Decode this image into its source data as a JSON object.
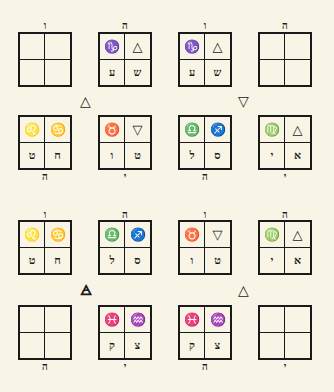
{
  "diagram": {
    "rows": [
      {
        "boxes": [
          {
            "top_label": "ו",
            "bottom_label": "",
            "cells": [
              "",
              "",
              "",
              ""
            ]
          },
          {
            "top_label": "ה",
            "bottom_label": "",
            "cells": [
              "♑",
              "△",
              "ע",
              "ש"
            ]
          },
          {
            "top_label": "ו",
            "bottom_label": "",
            "cells": [
              "♑",
              "△",
              "ע",
              "ש"
            ]
          },
          {
            "top_label": "ה",
            "bottom_label": "",
            "cells": [
              "",
              "",
              "",
              ""
            ]
          }
        ]
      },
      {
        "boxes": [
          {
            "top_label": "",
            "bottom_label": "ה",
            "cells": [
              "♌",
              "♋",
              "ט",
              "ח"
            ]
          },
          {
            "top_label": "",
            "bottom_label": "י",
            "cells": [
              "♉",
              "▽",
              "ו",
              "ט"
            ]
          },
          {
            "top_label": "",
            "bottom_label": "ה",
            "cells": [
              "♎",
              "♐",
              "ל",
              "ס"
            ]
          },
          {
            "top_label": "",
            "bottom_label": "י",
            "cells": [
              "♍",
              "△",
              "י",
              "א"
            ]
          }
        ]
      },
      {
        "boxes": [
          {
            "top_label": "ו",
            "bottom_label": "",
            "cells": [
              "♌",
              "♋",
              "ט",
              "ח"
            ]
          },
          {
            "top_label": "ה",
            "bottom_label": "",
            "cells": [
              "♎",
              "♐",
              "ל",
              "ס"
            ]
          },
          {
            "top_label": "ו",
            "bottom_label": "",
            "cells": [
              "♉",
              "▽",
              "ו",
              "ט"
            ]
          },
          {
            "top_label": "ה",
            "bottom_label": "",
            "cells": [
              "♍",
              "△",
              "י",
              "א"
            ]
          }
        ]
      },
      {
        "boxes": [
          {
            "top_label": "",
            "bottom_label": "ה",
            "cells": [
              "",
              "",
              "",
              ""
            ]
          },
          {
            "top_label": "",
            "bottom_label": "י",
            "cells": [
              "♓",
              "♒",
              "ק",
              "צ"
            ]
          },
          {
            "top_label": "",
            "bottom_label": "ה",
            "cells": [
              "♓",
              "♒",
              "ק",
              "צ"
            ]
          },
          {
            "top_label": "",
            "bottom_label": "י",
            "cells": [
              "",
              "",
              "",
              ""
            ]
          }
        ]
      }
    ],
    "element_symbols": [
      {
        "glyph": "△",
        "meaning": "fire"
      },
      {
        "glyph": "▽",
        "meaning": "water"
      },
      {
        "glyph": "🜁",
        "meaning": "air"
      },
      {
        "glyph": "△",
        "meaning": "fire"
      }
    ]
  }
}
